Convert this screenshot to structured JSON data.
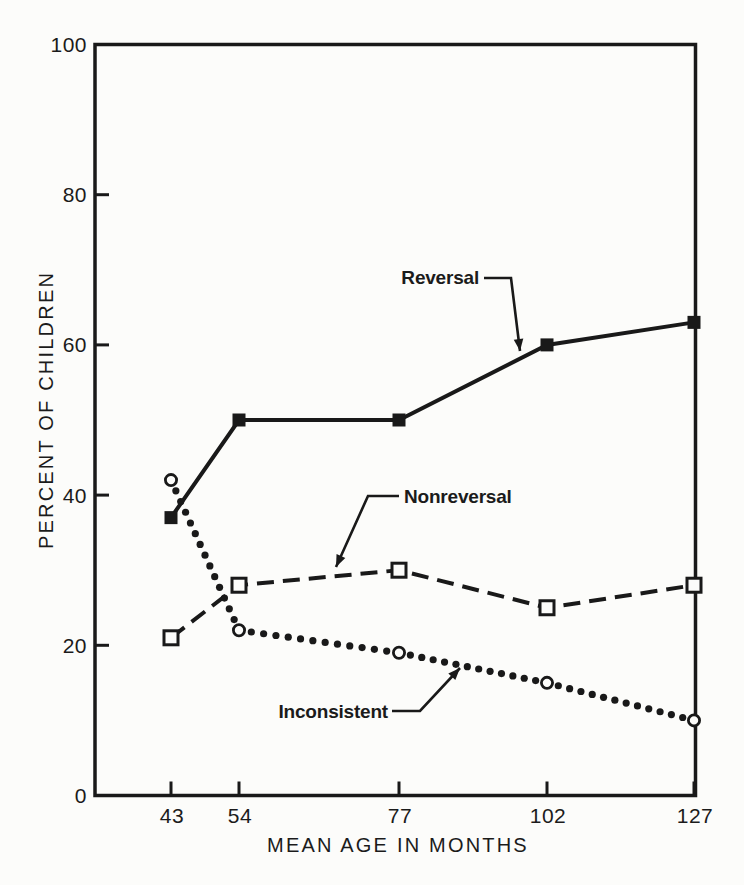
{
  "figure": {
    "paper_color": "#fcfcfa",
    "ink_color": "#191919"
  },
  "chart_data": {
    "type": "line",
    "title": "",
    "xlabel": "MEAN AGE IN MONTHS",
    "ylabel": "PERCENT OF CHILDREN",
    "x": [
      43,
      54,
      77,
      102,
      127
    ],
    "x_tick_labels": [
      "43",
      "54",
      "77",
      "102",
      "127"
    ],
    "ylim": [
      0,
      100
    ],
    "y_ticks": [
      0,
      20,
      40,
      60,
      80,
      100
    ],
    "y_tick_labels": [
      "0",
      "20",
      "40",
      "60",
      "80",
      "100"
    ],
    "grid": false,
    "frame": "full-box",
    "legend_position": "inline-annotations",
    "series": [
      {
        "name": "Reversal",
        "line_style": "solid",
        "marker": "filled-square",
        "values": [
          37,
          50,
          50,
          60,
          63
        ]
      },
      {
        "name": "Nonreversal",
        "line_style": "dashed",
        "marker": "open-square",
        "values": [
          21,
          28,
          30,
          25,
          28
        ]
      },
      {
        "name": "Inconsistent",
        "line_style": "dotted",
        "marker": "open-circle",
        "values": [
          42,
          22,
          19,
          15,
          10
        ]
      }
    ],
    "annotations": [
      {
        "text": "Reversal",
        "anchor": "end",
        "tx": 479,
        "ty": 284,
        "arrow": [
          [
            484,
            278
          ],
          [
            511,
            278
          ],
          [
            520,
            351
          ]
        ]
      },
      {
        "text": "Nonreversal",
        "anchor": "start",
        "tx": 404,
        "ty": 503,
        "arrow": [
          [
            399,
            496
          ],
          [
            368,
            496
          ],
          [
            336,
            567
          ]
        ]
      },
      {
        "text": "Inconsistent",
        "anchor": "end",
        "tx": 388,
        "ty": 718,
        "arrow": [
          [
            392,
            711
          ],
          [
            420,
            711
          ],
          [
            460,
            668
          ]
        ]
      }
    ],
    "layout": {
      "plot": {
        "left": 95,
        "top": 44.5,
        "right": 695.5,
        "bottom": 795.5
      },
      "x_tick_px": [
        171,
        239,
        399,
        547,
        694
      ],
      "x_tick_label_y": 823,
      "x_title_x": 398,
      "x_title_y": 852,
      "y_title_x": 53,
      "y_title_y": 410,
      "dot_spacing": 12,
      "dot_radius": 3.6,
      "line_width": 4,
      "dash_pattern": "17 9",
      "axis_width": 3.5,
      "tick_len": 14
    }
  }
}
